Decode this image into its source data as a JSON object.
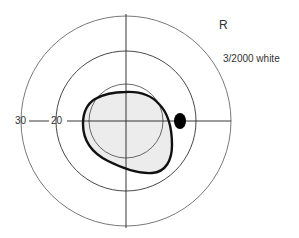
{
  "figure": {
    "eye_label": "R",
    "stimulus_label": "3/2000 white",
    "axis_labels": {
      "outer": "30",
      "middle": "20"
    }
  },
  "geometry": {
    "center": [
      126,
      121
    ],
    "rings": [
      {
        "name": "outer",
        "degrees": 30,
        "r": 105
      },
      {
        "name": "middle",
        "degrees": 20,
        "r": 70
      },
      {
        "name": "inner",
        "degrees": 10,
        "r": 37
      }
    ],
    "blind_spot": {
      "cx": 180,
      "cy": 121,
      "rx": 6,
      "ry": 8
    },
    "field_colors": {
      "fill": "#ececec",
      "stroke": "#111111",
      "grid": "#555555"
    }
  }
}
